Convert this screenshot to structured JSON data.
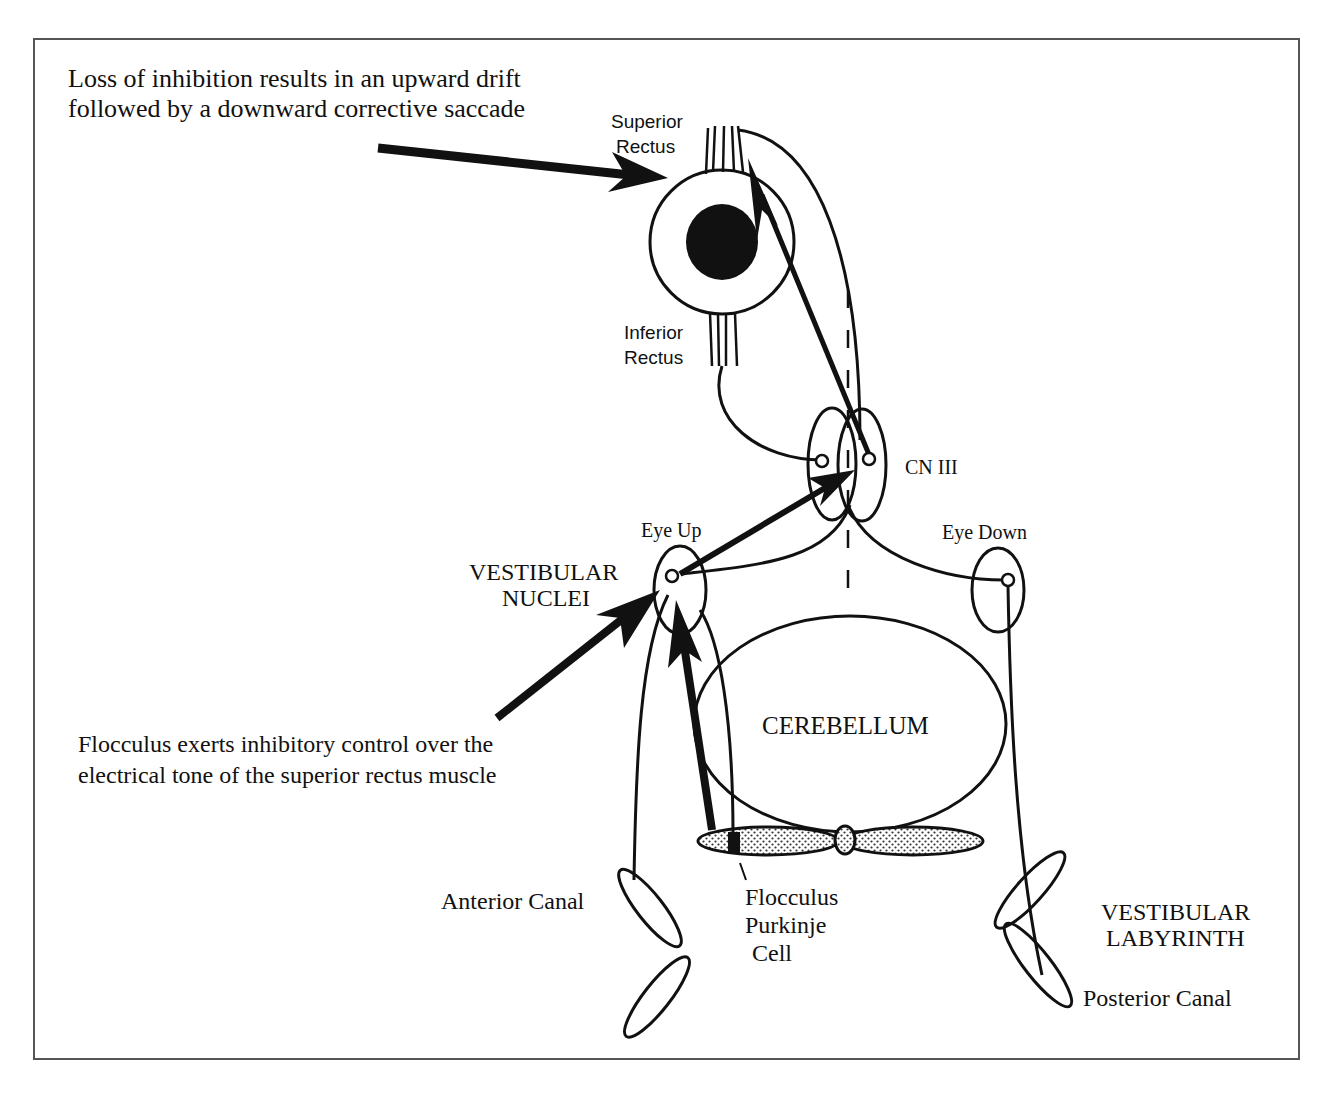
{
  "figure": {
    "frame_border_color": "#555555",
    "ink_color": "#111111",
    "annotations": {
      "top": {
        "line1": "Loss of inhibition results in an upward drift",
        "line2": "followed by a downward corrective saccade"
      },
      "bottom": {
        "line1": "Flocculus exerts inhibitory control over the",
        "line2": "electrical tone of the superior rectus muscle"
      }
    },
    "labels": {
      "superior_rectus": [
        "Superior",
        "Rectus"
      ],
      "inferior_rectus": [
        "Inferior",
        "Rectus"
      ],
      "cn3": "CN III",
      "eye_up": "Eye Up",
      "eye_down": "Eye Down",
      "vestibular_nuclei": [
        "VESTIBULAR",
        "NUCLEI"
      ],
      "cerebellum": "CEREBELLUM",
      "anterior_canal": "Anterior Canal",
      "flocculus_purkinje": [
        "Flocculus",
        "Purkinje",
        "Cell"
      ],
      "vestibular_labyrinth": [
        "VESTIBULAR",
        "LABYRINTH"
      ],
      "posterior_canal": "Posterior Canal"
    }
  }
}
